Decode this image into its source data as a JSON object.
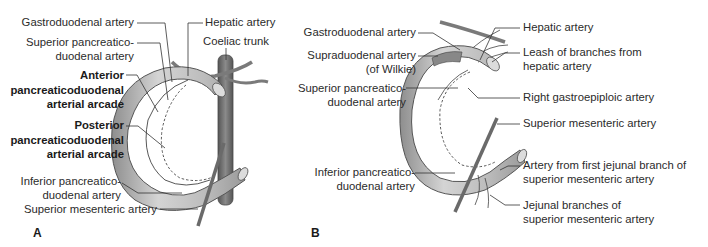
{
  "figure_a": {
    "panel_label": "A",
    "labels": {
      "gastroduodenal": "Gastroduodenal artery",
      "hepatic": "Hepatic artery",
      "coeliac": "Coeliac trunk",
      "superior_pd_1": "Superior pancreatico-",
      "superior_pd_2": "duodenal artery",
      "anterior_1": "Anterior",
      "anterior_2": "pancreaticoduodenal",
      "anterior_3": "arterial arcade",
      "posterior_1": "Posterior",
      "posterior_2": "pancreaticoduodenal",
      "posterior_3": "arterial arcade",
      "inferior_pd_1": "Inferior pancreatico-",
      "inferior_pd_2": "duodenal artery",
      "sma": "Superior mesenteric artery"
    }
  },
  "figure_b": {
    "panel_label": "B",
    "labels": {
      "gastroduodenal": "Gastroduodenal artery",
      "supraduodenal_1": "Supraduodenal artery",
      "supraduodenal_2": "(of Wilkie)",
      "superior_pd_1": "Superior pancreatico-",
      "superior_pd_2": "duodenal artery",
      "inferior_pd_1": "Inferior pancreatico-",
      "inferior_pd_2": "duodenal artery",
      "hepatic": "Hepatic artery",
      "leash_1": "Leash of branches from",
      "leash_2": "hepatic artery",
      "right_gastroepiploic": "Right gastroepiploic artery",
      "sma": "Superior mesenteric artery",
      "first_jejunal_1": "Artery from first jejunal branch of",
      "first_jejunal_2": "superior mesenteric artery",
      "jejunal_1": "Jejunal branches of",
      "jejunal_2": "superior mesenteric artery"
    }
  },
  "colors": {
    "duodenum_fill": "#b9b9b9",
    "vessel": "#707070",
    "leader_line": "#333333"
  }
}
